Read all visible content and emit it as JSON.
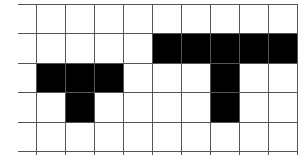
{
  "diagram": {
    "type": "grid-shapes",
    "grid": {
      "columns": 9,
      "rows": 5,
      "cell_size_px": 29,
      "origin_x": 36,
      "origin_y": 4,
      "left_margin_x": 18,
      "line_color": "#555555",
      "background": "#ffffff"
    },
    "shapes": [
      {
        "name": "small-t-shape",
        "color": "#000000",
        "cells": [
          [
            0,
            2
          ],
          [
            1,
            2
          ],
          [
            2,
            2
          ],
          [
            1,
            3
          ]
        ]
      },
      {
        "name": "large-t-shape",
        "color": "#000000",
        "cells": [
          [
            4,
            1
          ],
          [
            5,
            1
          ],
          [
            6,
            1
          ],
          [
            7,
            1
          ],
          [
            8,
            1
          ],
          [
            6,
            2
          ],
          [
            6,
            3
          ]
        ]
      }
    ]
  }
}
